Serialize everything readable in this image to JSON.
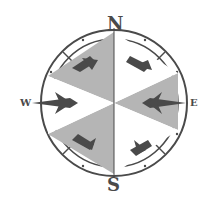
{
  "image": {
    "subject": "compass-rose",
    "labels": {
      "north": "N",
      "south": "S",
      "west": "W",
      "east": "E"
    },
    "colors": {
      "ink": "#4a4a4a",
      "fill": "#b5b5b5",
      "background": "#ffffff"
    }
  }
}
